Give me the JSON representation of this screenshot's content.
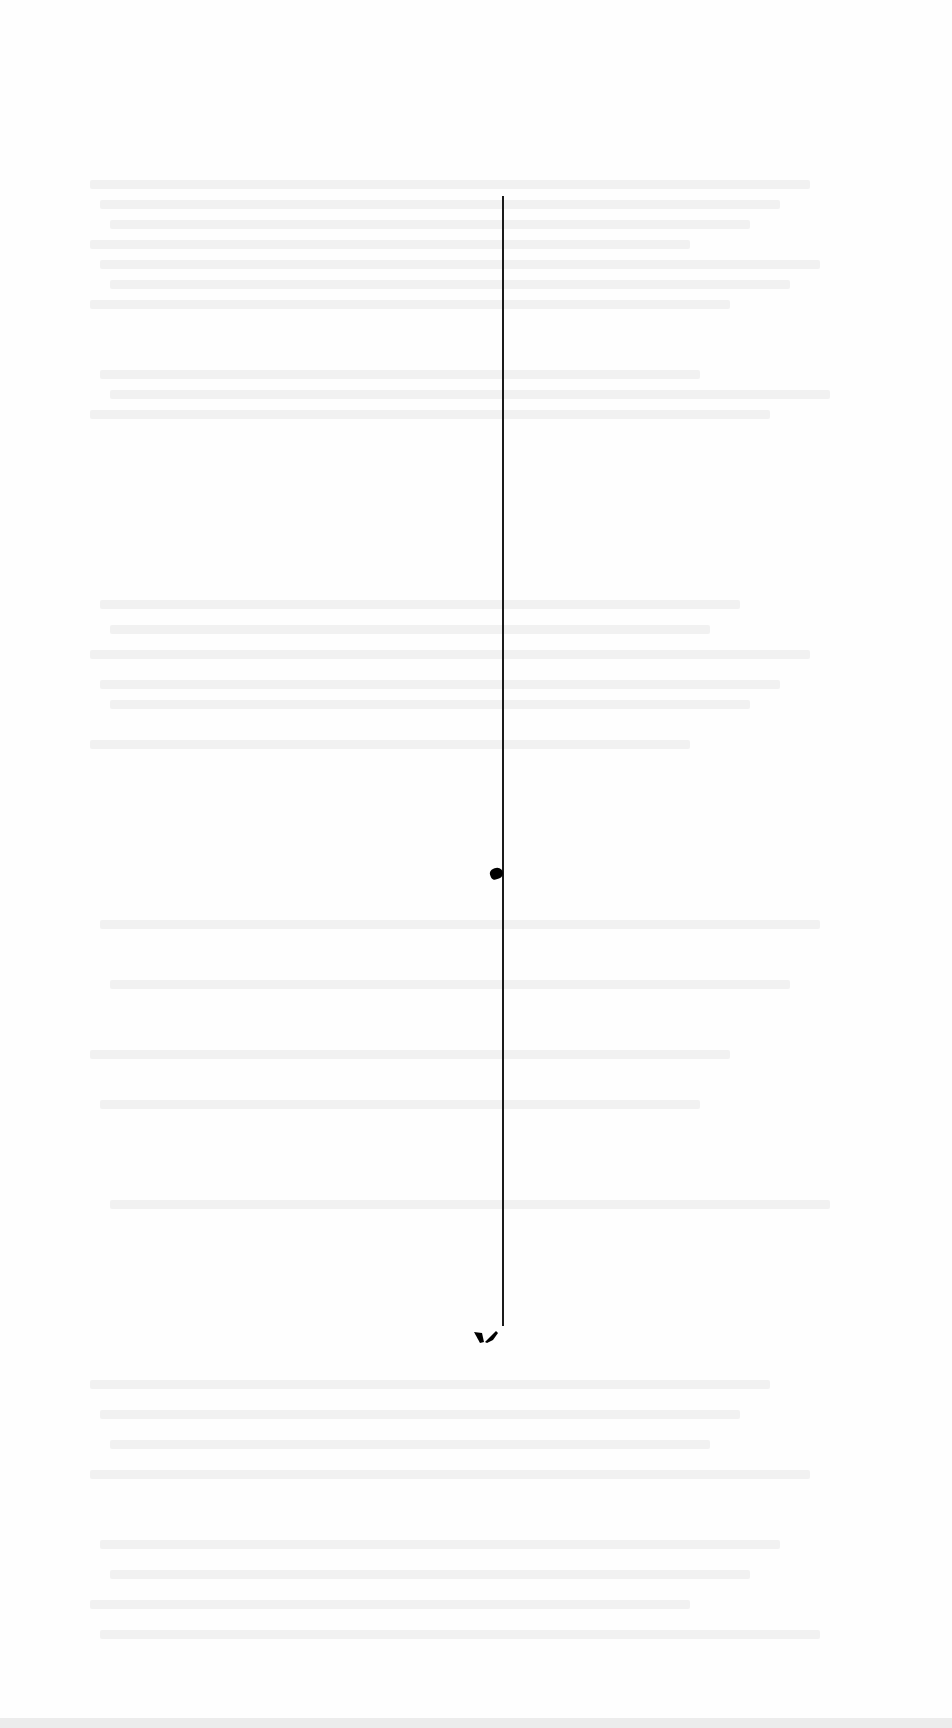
{
  "document": {
    "type": "scanned page",
    "readable_text": "",
    "description": "Blank scanned page with faint illegible bleed-through text, a vertical rule and ink marks"
  },
  "elements": {
    "vertical_rule": {
      "x": 502,
      "top": 196,
      "bottom": 1326
    },
    "ink_marks": [
      {
        "name": "blot-mid",
        "x": 496,
        "y": 873
      },
      {
        "name": "blot-bottom",
        "x": 485,
        "y": 1337
      }
    ]
  },
  "colors": {
    "paper": "#fefefe",
    "ink": "#1a1a1a",
    "bleed": "#f1f1f1"
  }
}
